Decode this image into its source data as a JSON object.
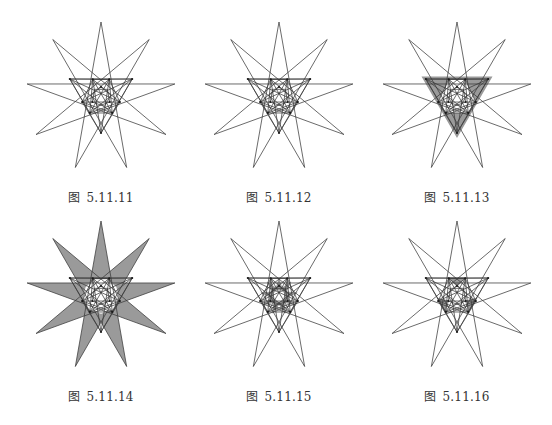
{
  "page": {
    "background": "#ffffff",
    "line_color": "#3a3a3a",
    "shade_color": "#9a9a9a",
    "dot_color": "#1a1a1a"
  },
  "star": {
    "points": 9,
    "step": 4,
    "radius": 75,
    "inner_ring": {
      "outer_radius": 36,
      "outer_angles": [
        -150,
        -30,
        90
      ],
      "inner_radius": 19.5,
      "inner_angles": [
        -115,
        -65,
        15,
        55,
        125,
        165
      ]
    }
  },
  "figures": [
    {
      "id": "fig-5-11-11",
      "caption_prefix": "图",
      "caption_number": "5.11.11",
      "cx": 101,
      "cy": 97,
      "shading": "none"
    },
    {
      "id": "fig-5-11-12",
      "caption_prefix": "图",
      "caption_number": "5.11.12",
      "cx": 279,
      "cy": 97,
      "shading": "none"
    },
    {
      "id": "fig-5-11-13",
      "caption_prefix": "图",
      "caption_number": "5.11.13",
      "cx": 457,
      "cy": 97,
      "shading": "triangle-band"
    },
    {
      "id": "fig-5-11-14",
      "caption_prefix": "图",
      "caption_number": "5.11.14",
      "cx": 101,
      "cy": 296,
      "shading": "spikes"
    },
    {
      "id": "fig-5-11-15",
      "caption_prefix": "图",
      "caption_number": "5.11.15",
      "cx": 279,
      "cy": 296,
      "shading": "center-star"
    },
    {
      "id": "fig-5-11-16",
      "caption_prefix": "图",
      "caption_number": "5.11.16",
      "cx": 457,
      "cy": 296,
      "shading": "three-triangles"
    }
  ],
  "captions_y": [
    196,
    395
  ]
}
